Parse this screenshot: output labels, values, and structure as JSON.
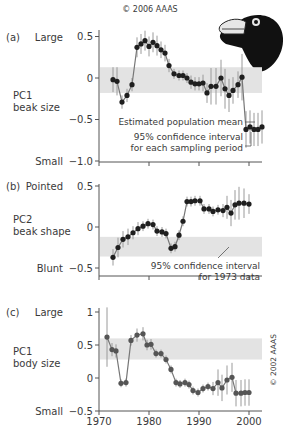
{
  "copyright_top": "© 2006 AAAS",
  "copyright_side": "© 2002 AAAS",
  "colors": {
    "band": "#e3e3e3",
    "axis": "#555555",
    "text": "#3a3a3a",
    "dark_point": "#1f1f1f",
    "grey_point": "#555555",
    "errorbar": "#9a9a9a",
    "line": "#777777"
  },
  "x_axis": {
    "min": 1970,
    "max": 2003,
    "ticks": [
      "1970",
      "1980",
      "1990",
      "2000"
    ]
  },
  "chart_data": [
    {
      "id": "a",
      "type": "line",
      "panel_label": "(a)",
      "top_label": "Large",
      "bottom_label": "Small",
      "ylabel": [
        "PC1",
        "beak size"
      ],
      "ylim": [
        -1.0,
        0.55
      ],
      "yticks": [
        "0.5",
        "0",
        "-0.5",
        "-1.0"
      ],
      "ytick_values": [
        0.5,
        0,
        -0.5,
        -1.0
      ],
      "band": [
        -0.18,
        0.13
      ],
      "annotations": [
        "Estimated population mean",
        "95% confidence interval",
        "for each sampling period"
      ],
      "x": [
        1972.8,
        1973.6,
        1974.6,
        1975.6,
        1976.6,
        1977.6,
        1978.4,
        1979.2,
        1980.0,
        1980.8,
        1981.6,
        1982.4,
        1983.2,
        1984.0,
        1985.0,
        1986.0,
        1986.8,
        1987.6,
        1988.4,
        1989.2,
        1990.0,
        1990.8,
        1991.6,
        1992.4,
        1993.4,
        1994.4,
        1995.2,
        1996.0,
        1996.8,
        1997.8,
        1998.6,
        1999.4,
        2000.2,
        2001.0,
        2001.8,
        2002.6
      ],
      "y": [
        -0.02,
        -0.04,
        -0.29,
        -0.21,
        -0.08,
        0.37,
        0.41,
        0.45,
        0.38,
        0.43,
        0.39,
        0.34,
        0.3,
        0.15,
        0.05,
        0.03,
        0.03,
        0.0,
        -0.05,
        -0.07,
        -0.07,
        -0.06,
        -0.18,
        -0.1,
        -0.1,
        0.0,
        -0.13,
        -0.21,
        -0.15,
        -0.08,
        0.01,
        -0.62,
        -0.59,
        -0.62,
        -0.62,
        -0.59
      ],
      "err": [
        0.15,
        0.17,
        0.08,
        0.08,
        0.08,
        0.12,
        0.12,
        0.12,
        0.12,
        0.12,
        0.12,
        0.1,
        0.1,
        0.08,
        0.06,
        0.06,
        0.06,
        0.06,
        0.08,
        0.08,
        0.08,
        0.1,
        0.12,
        0.22,
        0.22,
        0.22,
        0.24,
        0.2,
        0.16,
        0.16,
        0.28,
        0.22,
        0.2,
        0.2,
        0.2,
        0.2
      ]
    },
    {
      "id": "b",
      "type": "line",
      "panel_label": "(b)",
      "top_label": "Pointed",
      "bottom_label": "Blunt",
      "ylabel": [
        "PC2",
        "beak shape"
      ],
      "ylim": [
        -0.55,
        0.55
      ],
      "yticks": [
        "0.5",
        "0",
        "-0.5"
      ],
      "ytick_values": [
        0.5,
        0,
        -0.5
      ],
      "band": [
        -0.36,
        -0.12
      ],
      "annotations": [
        "95% confidence interval",
        "for 1973 data"
      ],
      "x": [
        1972.8,
        1973.8,
        1974.8,
        1975.8,
        1976.8,
        1977.8,
        1978.8,
        1979.8,
        1980.8,
        1981.6,
        1982.6,
        1983.4,
        1984.4,
        1985.2,
        1986.0,
        1986.8,
        1987.6,
        1988.4,
        1989.2,
        1990.2,
        1991.0,
        1992.0,
        1992.8,
        1993.8,
        1994.8,
        1995.6,
        1996.4,
        1997.2,
        1998.0,
        1999.0,
        2000.0
      ],
      "y": [
        -0.37,
        -0.25,
        -0.15,
        -0.12,
        -0.07,
        -0.02,
        0.01,
        0.04,
        0.03,
        -0.05,
        -0.06,
        -0.08,
        -0.26,
        -0.24,
        -0.1,
        0.07,
        0.31,
        0.31,
        0.32,
        0.32,
        0.22,
        0.22,
        0.19,
        0.21,
        0.2,
        0.24,
        0.17,
        0.27,
        0.29,
        0.29,
        0.28
      ],
      "err": [
        0.1,
        0.12,
        0.1,
        0.1,
        0.08,
        0.08,
        0.06,
        0.06,
        0.06,
        0.06,
        0.06,
        0.06,
        0.06,
        0.06,
        0.06,
        0.06,
        0.06,
        0.06,
        0.06,
        0.06,
        0.06,
        0.06,
        0.06,
        0.06,
        0.08,
        0.14,
        0.16,
        0.18,
        0.2,
        0.18,
        0.12
      ]
    },
    {
      "id": "c",
      "type": "line",
      "panel_label": "(c)",
      "top_label": "Large",
      "bottom_label": "Small",
      "ylabel": [
        "PC1",
        "body size"
      ],
      "ylim": [
        -0.5,
        1.05
      ],
      "yticks": [
        "1",
        "0.5",
        "0",
        "-0.5"
      ],
      "ytick_values": [
        1,
        0.5,
        0,
        -0.5
      ],
      "band": [
        0.28,
        0.6
      ],
      "x": [
        1971.6,
        1972.6,
        1973.4,
        1974.4,
        1975.4,
        1976.4,
        1977.6,
        1978.8,
        1979.6,
        1980.4,
        1981.4,
        1982.4,
        1983.4,
        1984.4,
        1985.4,
        1986.2,
        1987.2,
        1988.0,
        1988.8,
        1989.8,
        1990.8,
        1991.8,
        1992.8,
        1993.8,
        1994.6,
        1995.6,
        1996.6,
        1997.4,
        1998.4,
        1999.2,
        2000.0
      ],
      "y": [
        0.62,
        0.43,
        0.41,
        -0.08,
        -0.07,
        0.57,
        0.65,
        0.67,
        0.5,
        0.51,
        0.37,
        0.37,
        0.28,
        0.13,
        -0.07,
        -0.09,
        -0.07,
        -0.1,
        -0.19,
        -0.22,
        -0.16,
        -0.13,
        -0.16,
        -0.07,
        -0.15,
        -0.03,
        0.01,
        -0.23,
        -0.23,
        -0.22,
        -0.22
      ],
      "err": [
        0.45,
        0.1,
        0.1,
        0.06,
        0.06,
        0.08,
        0.1,
        0.1,
        0.08,
        0.08,
        0.06,
        0.06,
        0.06,
        0.06,
        0.06,
        0.06,
        0.06,
        0.06,
        0.06,
        0.06,
        0.06,
        0.06,
        0.1,
        0.2,
        0.2,
        0.22,
        0.22,
        0.2,
        0.2,
        0.2,
        0.2
      ]
    }
  ]
}
